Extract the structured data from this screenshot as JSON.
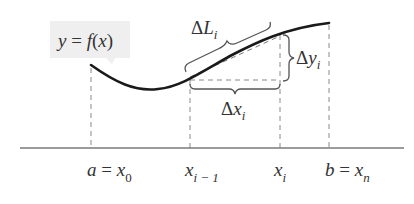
{
  "diagram": {
    "function_label": "y = f(x)",
    "function_label_parts": {
      "y": "y",
      "eq": " = ",
      "f": "f",
      "open": "(",
      "x": "x",
      "close": ")"
    },
    "arc_length_label": {
      "symbol": "Δ",
      "var": "L",
      "sub": "i"
    },
    "delta_y_label": {
      "symbol": "Δ",
      "var": "y",
      "sub": "i"
    },
    "delta_x_label": {
      "symbol": "Δ",
      "var": "x",
      "sub": "i"
    },
    "axis_labels": [
      {
        "prefix": "a = ",
        "var": "x",
        "sub": "0"
      },
      {
        "prefix": "",
        "var": "x",
        "sub": "i − 1"
      },
      {
        "prefix": "",
        "var": "x",
        "sub": "i"
      },
      {
        "prefix": "b = ",
        "var": "x",
        "sub": "n"
      }
    ],
    "colors": {
      "curve": "#1a1a1a",
      "axis": "#7a7a7a",
      "dashed": "#8a8a8a",
      "brace": "#555555",
      "label_box": "#efefef",
      "text": "#333333"
    }
  }
}
